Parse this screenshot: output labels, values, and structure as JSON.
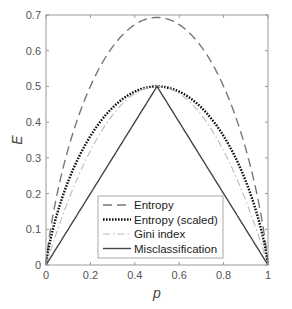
{
  "chart_data": {
    "type": "line",
    "title": "",
    "xlabel": "p",
    "ylabel": "E",
    "xlim": [
      0,
      1
    ],
    "ylim": [
      0,
      0.7
    ],
    "grid": false,
    "legend_position": "lower center (inside axes)",
    "x_ticks": [
      "0",
      "0.2",
      "0.4",
      "0.6",
      "0.8",
      "1"
    ],
    "y_ticks": [
      "0",
      "0.1",
      "0.2",
      "0.3",
      "0.4",
      "0.5",
      "0.6",
      "0.7"
    ],
    "x": [
      0,
      0.1,
      0.2,
      0.3,
      0.4,
      0.5,
      0.6,
      0.7,
      0.8,
      0.9,
      1.0
    ],
    "series": [
      {
        "name": "Entropy",
        "style": "dashed",
        "color": "#777777",
        "formula": "-p ln p - (1-p) ln(1-p)",
        "values": [
          0,
          0.325,
          0.5,
          0.611,
          0.673,
          0.693,
          0.673,
          0.611,
          0.5,
          0.325,
          0
        ]
      },
      {
        "name": "Entropy (scaled)",
        "style": "dotted",
        "color": "#111111",
        "formula": "entropy / (2 ln 2)",
        "values": [
          0,
          0.234,
          0.361,
          0.441,
          0.485,
          0.5,
          0.485,
          0.441,
          0.361,
          0.234,
          0
        ]
      },
      {
        "name": "Gini index",
        "style": "dash-dot",
        "color": "#bbbbbb",
        "formula": "2p(1-p)",
        "values": [
          0,
          0.18,
          0.32,
          0.42,
          0.48,
          0.5,
          0.48,
          0.42,
          0.32,
          0.18,
          0
        ]
      },
      {
        "name": "Misclassification",
        "style": "solid",
        "color": "#444444",
        "formula": "min(p, 1-p)",
        "values": [
          0,
          0.1,
          0.2,
          0.3,
          0.4,
          0.5,
          0.4,
          0.3,
          0.2,
          0.1,
          0
        ]
      }
    ]
  }
}
